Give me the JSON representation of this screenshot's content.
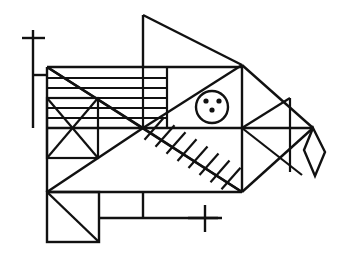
{
  "figure": {
    "title": "Geometric line drawing of a fish",
    "style": {
      "stroke_color": "#111111",
      "background_color": "#ffffff",
      "stroke_width": 2.2,
      "thin_stroke_width": 1.8
    },
    "canvas": {
      "width": 342,
      "height": 261,
      "viewbox": "0 0 342 261"
    },
    "parts": [
      {
        "name": "upper-left-cross-mark",
        "kind": "cross",
        "vertical": [
          33,
          30,
          33,
          128
        ],
        "horizontal": [
          22,
          38,
          45,
          38
        ],
        "stem": [
          33,
          75,
          47,
          75
        ]
      },
      {
        "name": "body-outer-rectangle",
        "kind": "rect",
        "x": 47,
        "y": 67,
        "width": 195,
        "height": 125
      },
      {
        "name": "dorsal-fin-triangle",
        "kind": "polyline",
        "points": "143,15 143,67 242,65"
      },
      {
        "name": "tail-upper-edge",
        "kind": "line",
        "points": "242,65 313,128"
      },
      {
        "name": "tail-lower-edge",
        "kind": "line",
        "points": "242,192 313,128"
      },
      {
        "name": "tail-inner-diagonal-upper",
        "kind": "line",
        "points": "242,128 290,98"
      },
      {
        "name": "tail-inner-diagonal-lower",
        "kind": "line",
        "points": "242,128 300,172"
      },
      {
        "name": "tail-vertical-divider",
        "kind": "line",
        "points": "290,98 290,172"
      },
      {
        "name": "diamond-tail-tip",
        "kind": "polygon",
        "points": "313,128 325,152 315,176 304,150"
      },
      {
        "name": "eye-circle",
        "kind": "circle",
        "cx": 212,
        "cy": 107,
        "r": 16
      },
      {
        "name": "eye-dots",
        "kind": "dots",
        "radius": 2.6,
        "points": [
          [
            206,
            101
          ],
          [
            219,
            101
          ],
          [
            212,
            110
          ]
        ]
      },
      {
        "name": "horizontal-stripes",
        "kind": "stripes",
        "x_start": 47,
        "x_end": 167,
        "y_values": [
          78,
          88,
          98,
          108,
          118
        ]
      },
      {
        "name": "fishbone-diagonal",
        "kind": "line",
        "points": "143,128 242,192"
      },
      {
        "name": "fishbone-ticks",
        "kind": "ticks",
        "count": 8,
        "length": 22
      },
      {
        "name": "center-star-diagonals",
        "kind": "lines",
        "segments": [
          "47,67 143,128",
          "143,128 242,65",
          "143,128 47,192",
          "47,67 242,192"
        ]
      },
      {
        "name": "mid-horizontal-rule",
        "kind": "line",
        "points": "47,128 313,128"
      },
      {
        "name": "left-x-box",
        "kind": "rect-with-cross",
        "x": 47,
        "y": 98,
        "width": 51,
        "height": 60
      },
      {
        "name": "lower-left-diagonal-box",
        "kind": "rect-with-diagonal",
        "x": 47,
        "y": 192,
        "width": 52,
        "height": 50
      },
      {
        "name": "belly-horizontal",
        "kind": "line",
        "points": "99,218 218,218"
      },
      {
        "name": "belly-vertical",
        "kind": "line",
        "points": "143,192 143,218"
      },
      {
        "name": "lower-cross-mark",
        "kind": "cross",
        "vertical": [
          205,
          205,
          205,
          232
        ],
        "horizontal": [
          188,
          218,
          222,
          218
        ]
      },
      {
        "name": "gill-vertical-a",
        "kind": "line",
        "points": "167,67 167,128"
      },
      {
        "name": "gill-vertical-b",
        "kind": "line",
        "points": "143,67 143,128"
      },
      {
        "name": "head-vertical",
        "kind": "line",
        "points": "242,65 242,192"
      }
    ]
  }
}
